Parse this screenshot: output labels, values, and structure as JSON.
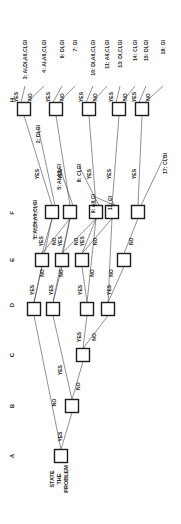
{
  "diagram": {
    "type": "decision-tree",
    "orientation": "rotated-90-ccw",
    "colors": {
      "line": "#444444",
      "box_stroke": "#1c1c1c",
      "text": "#222222",
      "background": "#ffffff"
    },
    "column_labels": [
      {
        "id": "A",
        "text": "A",
        "x": 14,
        "y": 456
      },
      {
        "id": "B",
        "text": "B",
        "x": 14,
        "y": 406
      },
      {
        "id": "C",
        "text": "C",
        "x": 14,
        "y": 355
      },
      {
        "id": "D",
        "text": "D",
        "x": 14,
        "y": 305
      },
      {
        "id": "E",
        "text": "E",
        "x": 14,
        "y": 260
      },
      {
        "id": "F",
        "text": "F",
        "x": 14,
        "y": 213
      },
      {
        "id": "H",
        "text": "H",
        "x": 14,
        "y": 100
      }
    ],
    "start_label": [
      "STATE",
      "THE",
      "PROBLEM"
    ],
    "nodes": [
      {
        "id": "A1",
        "col": "A",
        "x": 61,
        "y": 456
      },
      {
        "id": "B1",
        "col": "B",
        "x": 72,
        "y": 406
      },
      {
        "id": "C1",
        "col": "C",
        "x": 83,
        "y": 355
      },
      {
        "id": "D1",
        "col": "D",
        "x": 34,
        "y": 309
      },
      {
        "id": "D2",
        "col": "D",
        "x": 53,
        "y": 309
      },
      {
        "id": "D3",
        "col": "D",
        "x": 87,
        "y": 309
      },
      {
        "id": "D4",
        "col": "D",
        "x": 108,
        "y": 309
      },
      {
        "id": "E1",
        "col": "E",
        "x": 42,
        "y": 260
      },
      {
        "id": "E2",
        "col": "E",
        "x": 62,
        "y": 260
      },
      {
        "id": "E3",
        "col": "E",
        "x": 82,
        "y": 260
      },
      {
        "id": "E4",
        "col": "E",
        "x": 124,
        "y": 260
      },
      {
        "id": "F1",
        "col": "F",
        "x": 52,
        "y": 212
      },
      {
        "id": "F2",
        "col": "F",
        "x": 70,
        "y": 212
      },
      {
        "id": "F3",
        "col": "F",
        "x": 96,
        "y": 212
      },
      {
        "id": "F4",
        "col": "F",
        "x": 112,
        "y": 212
      },
      {
        "id": "F5",
        "col": "F",
        "x": 138,
        "y": 212
      },
      {
        "id": "H1",
        "col": "H",
        "x": 24,
        "y": 109
      },
      {
        "id": "H2",
        "col": "H",
        "x": 56,
        "y": 109
      },
      {
        "id": "H3",
        "col": "H",
        "x": 89,
        "y": 109
      },
      {
        "id": "H4",
        "col": "H",
        "x": 119,
        "y": 109
      },
      {
        "id": "H5",
        "col": "H",
        "x": 142,
        "y": 109
      }
    ],
    "edges": [
      {
        "from": "A1",
        "to": "D1",
        "label": "NO"
      },
      {
        "from": "A1",
        "to": "B1",
        "label": "YES"
      },
      {
        "from": "B1",
        "to": "D2",
        "label": "YES"
      },
      {
        "from": "B1",
        "to": "C1",
        "label": "NO"
      },
      {
        "from": "C1",
        "to": "D3",
        "label": "YES"
      },
      {
        "from": "C1",
        "to": "D4",
        "label": "NO"
      },
      {
        "from": "D1",
        "to": "E1",
        "label": "YES"
      },
      {
        "from": "D1",
        "to": "F1",
        "label": "NO"
      },
      {
        "from": "D2",
        "to": "E2",
        "label": "YES"
      },
      {
        "from": "D2",
        "to": "F2",
        "label": "NO"
      },
      {
        "from": "D3",
        "to": "E3",
        "label": "YES"
      },
      {
        "from": "D3",
        "to": "F3",
        "label": "NO"
      },
      {
        "from": "D4",
        "to": "E4",
        "label": "YES"
      },
      {
        "from": "D4",
        "to": "F4",
        "label": "NO"
      },
      {
        "from": "E1",
        "to": "F1",
        "label": "YES"
      },
      {
        "from": "E1",
        "to": "F2",
        "label": "NO"
      },
      {
        "from": "E2",
        "to": "F2",
        "label": "YES"
      },
      {
        "from": "E2",
        "to": "F3",
        "label": "NO"
      },
      {
        "from": "E3",
        "to": "F3",
        "label": "YES"
      },
      {
        "from": "E3",
        "to": "F4",
        "label": "NO"
      },
      {
        "from": "E4",
        "to": "F5",
        "label": "NO"
      },
      {
        "from": "F1",
        "to": "H1",
        "label": "YES"
      },
      {
        "from": "F2",
        "to": "H2",
        "label": "YES"
      },
      {
        "from": "F3",
        "to": "H3",
        "label": "YES"
      },
      {
        "from": "F4",
        "to": "H4",
        "label": "YES"
      },
      {
        "from": "F5",
        "to": "H5",
        "label": "YES"
      }
    ],
    "outcomes": [
      {
        "id": "1",
        "text": "1: AI,DI,AII,CI,GI",
        "x": 37,
        "y": 200
      },
      {
        "id": "2",
        "text": "2: DI,GI",
        "x": 40,
        "y": 125
      },
      {
        "id": "3",
        "text": "3: AI,DI,AII,CI,GI",
        "x": 27,
        "y": 40
      },
      {
        "id": "4",
        "text": "4: AI,AII,CI,GI",
        "x": 46,
        "y": 40
      },
      {
        "id": "5",
        "text": "5: AI,AII,CI",
        "x": 61,
        "y": 164
      },
      {
        "id": "6",
        "text": "6: DI,GI",
        "x": 64,
        "y": 40
      },
      {
        "id": "7",
        "text": "7: GI",
        "x": 77,
        "y": 40
      },
      {
        "id": "8",
        "text": "8: CI,GI",
        "x": 81,
        "y": 164
      },
      {
        "id": "9",
        "text": "9: AII,CI",
        "x": 95,
        "y": 194
      },
      {
        "id": "10",
        "text": "10: DI,AII,CI,GI",
        "x": 95,
        "y": 40
      },
      {
        "id": "11",
        "text": "11: AII,CI,GI",
        "x": 109,
        "y": 40
      },
      {
        "id": "12",
        "text": "12: CI",
        "x": 112,
        "y": 196
      },
      {
        "id": "13",
        "text": "13: DI,CI,GI",
        "x": 122,
        "y": 40
      },
      {
        "id": "14",
        "text": "14: CI,GI",
        "x": 137,
        "y": 40
      },
      {
        "id": "15",
        "text": "15: DI,GI",
        "x": 148,
        "y": 40
      },
      {
        "id": "16",
        "text": "16: GI",
        "x": 165,
        "y": 40
      },
      {
        "id": "17",
        "text": "17: CI,GI",
        "x": 167,
        "y": 153
      }
    ]
  }
}
